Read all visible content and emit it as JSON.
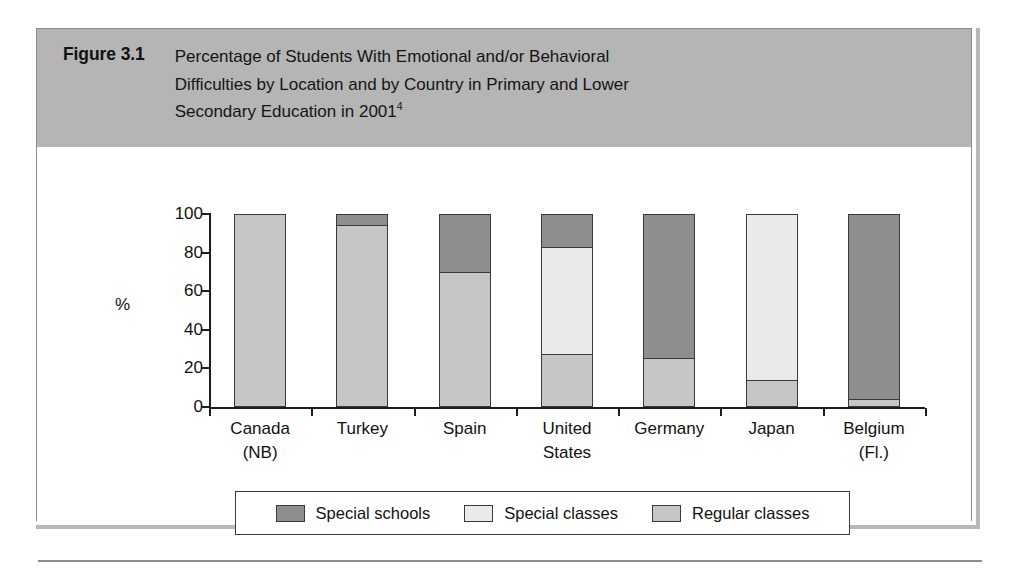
{
  "figure": {
    "number_label": "Figure 3.1",
    "title_line1": "Percentage of Students With Emotional and/or Behavioral",
    "title_line2": "Difficulties by Location and by Country in Primary and Lower",
    "title_line3": "Secondary Education in 2001",
    "title_footnote": "4"
  },
  "colors": {
    "special_schools": "#8e8e8e",
    "special_classes": "#eaeaea",
    "regular_classes": "#c6c6c6",
    "header_band": "#b5b5b5",
    "outline": "#3a3a3a",
    "axis": "#1d1d1d"
  },
  "chart_data": {
    "type": "bar",
    "subtype": "stacked-vertical-100pct",
    "title": "Percentage of Students With Emotional and/or Behavioral Difficulties by Location and by Country in Primary and Lower Secondary Education in 2001",
    "xlabel": "",
    "ylabel": "%",
    "ylim": [
      0,
      100
    ],
    "yticks": [
      0,
      20,
      40,
      60,
      80,
      100
    ],
    "ytick_labels": [
      "0",
      "20",
      "40",
      "60",
      "80",
      "100"
    ],
    "grid": false,
    "legend_position": "bottom",
    "categories": [
      "Canada\n(NB)",
      "Turkey",
      "Spain",
      "United\nStates",
      "Germany",
      "Japan",
      "Belgium\n(Fl.)"
    ],
    "category_labels": [
      [
        "Canada",
        "(NB)"
      ],
      [
        "Turkey",
        ""
      ],
      [
        "Spain",
        ""
      ],
      [
        "United",
        "States"
      ],
      [
        "Germany",
        ""
      ],
      [
        "Japan",
        ""
      ],
      [
        "Belgium",
        "(Fl.)"
      ]
    ],
    "series": [
      {
        "name": "Special schools",
        "color": "#8e8e8e",
        "values": [
          0,
          5,
          30,
          17,
          75,
          0,
          97
        ]
      },
      {
        "name": "Special classes",
        "color": "#eaeaea",
        "values": [
          0,
          0,
          0,
          56,
          0,
          87,
          0
        ]
      },
      {
        "name": "Regular classes",
        "color": "#c6c6c6",
        "values": [
          100,
          95,
          70,
          27,
          25,
          13,
          3
        ]
      }
    ],
    "stack_order_top_to_bottom": [
      "Special schools",
      "Special classes",
      "Regular classes"
    ]
  },
  "legend": {
    "items": [
      {
        "label": "Special schools",
        "color": "#8e8e8e"
      },
      {
        "label": "Special classes",
        "color": "#eaeaea"
      },
      {
        "label": "Regular classes",
        "color": "#c6c6c6"
      }
    ]
  }
}
